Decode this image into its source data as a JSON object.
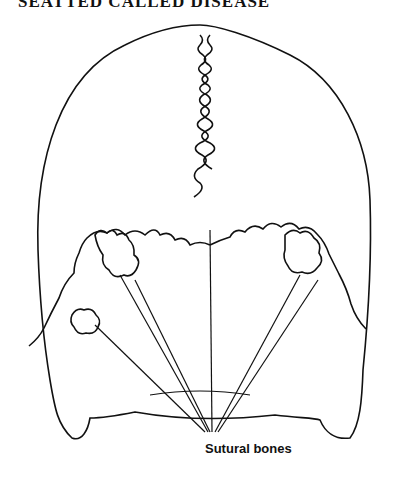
{
  "figure": {
    "title": "SEATTED CALLED DISEASE",
    "label": "Sutural bones"
  }
}
